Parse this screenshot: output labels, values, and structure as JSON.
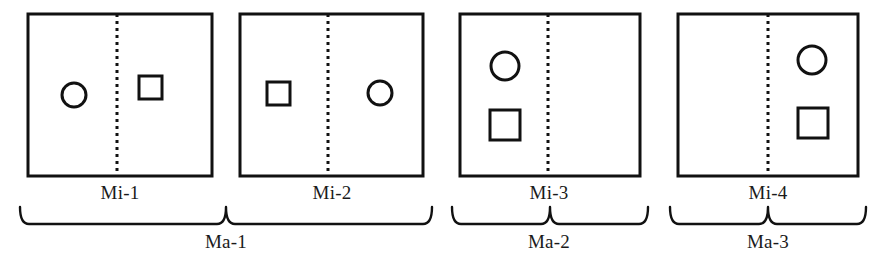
{
  "figure": {
    "background_color": "#ffffff",
    "stroke_color": "#111111",
    "text_color": "#1a1a1a"
  },
  "panels": [
    {
      "id": "panel-1",
      "minor_label": "Mi-1",
      "x": 28,
      "y": 14,
      "width": 184,
      "height": 162,
      "divider_x": 117,
      "shapes": [
        {
          "kind": "circle",
          "cx": 74,
          "cy": 95,
          "r": 12,
          "side": "left"
        },
        {
          "kind": "square",
          "x": 139,
          "y": 76,
          "size": 23,
          "side": "right"
        }
      ]
    },
    {
      "id": "panel-2",
      "minor_label": "Mi-2",
      "x": 240,
      "y": 14,
      "width": 183,
      "height": 162,
      "divider_x": 328,
      "shapes": [
        {
          "kind": "square",
          "x": 267,
          "y": 82,
          "size": 23,
          "side": "left"
        },
        {
          "kind": "circle",
          "cx": 380,
          "cy": 93,
          "r": 12,
          "side": "right"
        }
      ]
    },
    {
      "id": "panel-3",
      "minor_label": "Mi-3",
      "x": 460,
      "y": 14,
      "width": 180,
      "height": 162,
      "divider_x": 548,
      "shapes": [
        {
          "kind": "circle",
          "cx": 505,
          "cy": 66,
          "r": 14,
          "side": "left"
        },
        {
          "kind": "square",
          "x": 490,
          "y": 110,
          "size": 30,
          "side": "left"
        }
      ]
    },
    {
      "id": "panel-4",
      "minor_label": "Mi-4",
      "x": 678,
      "y": 14,
      "width": 180,
      "height": 162,
      "divider_x": 768,
      "shapes": [
        {
          "kind": "circle",
          "cx": 812,
          "cy": 60,
          "r": 14,
          "side": "right"
        },
        {
          "kind": "square",
          "x": 798,
          "y": 108,
          "size": 30,
          "side": "right"
        }
      ]
    }
  ],
  "minor_labels": [
    {
      "text": "Mi-1",
      "cx": 120,
      "y": 199
    },
    {
      "text": "Mi-2",
      "cx": 332,
      "y": 199
    },
    {
      "text": "Mi-3",
      "cx": 549,
      "y": 199
    },
    {
      "text": "Mi-4",
      "cx": 768,
      "y": 199
    }
  ],
  "major_groups": [
    {
      "id": "group-ma-1",
      "label": "Ma-1",
      "brace": {
        "x1": 20,
        "x2": 432,
        "top": 207,
        "bottom": 224
      },
      "label_cx": 226,
      "label_y": 248,
      "covers": [
        "Mi-1",
        "Mi-2"
      ]
    },
    {
      "id": "group-ma-2",
      "label": "Ma-2",
      "brace": {
        "x1": 452,
        "x2": 648,
        "top": 207,
        "bottom": 224
      },
      "label_cx": 549,
      "label_y": 248,
      "covers": [
        "Mi-3"
      ]
    },
    {
      "id": "group-ma-3",
      "label": "Ma-3",
      "brace": {
        "x1": 670,
        "x2": 866,
        "top": 207,
        "bottom": 224
      },
      "label_cx": 768,
      "label_y": 248,
      "covers": [
        "Mi-4"
      ]
    }
  ]
}
